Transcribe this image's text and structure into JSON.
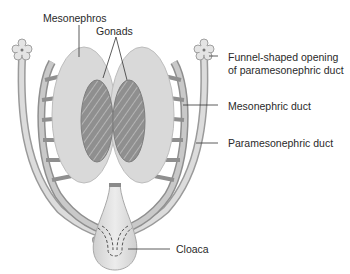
{
  "labels": {
    "mesonephros": "Mesonephros",
    "gonads": "Gonads",
    "funnel_line1": "Funnel-shaped opening",
    "funnel_line2": "of paramesonephric duct",
    "mesonephric_duct": "Mesonephric duct",
    "paramesonephric_duct": "Paramesonephric duct",
    "cloaca": "Cloaca"
  },
  "colors": {
    "mesonephros_fill": "#d9d9d9",
    "gonad_fill": "#9a9a9a",
    "duct_fill": "#cfcfcf",
    "outline": "#8c8c8c",
    "leader_line": "#333333"
  }
}
